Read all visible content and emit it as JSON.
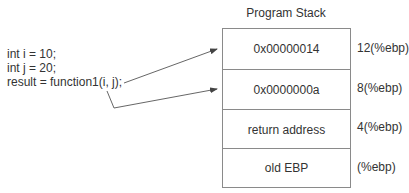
{
  "diagram": {
    "title": "Program Stack",
    "code_lines": [
      "int i = 10;",
      "int j = 20;",
      "result = function1(i, j);"
    ],
    "stack_cells": [
      {
        "value": "0x00000014",
        "offset": "12(%ebp)"
      },
      {
        "value": "0x0000000a",
        "offset": "8(%ebp)"
      },
      {
        "value": "return address",
        "offset": "4(%ebp)"
      },
      {
        "value": "old EBP",
        "offset": "(%ebp)"
      }
    ],
    "arrows": [
      {
        "from": "function1 argument j",
        "to": "0x00000014"
      },
      {
        "from": "function1 argument i",
        "to": "0x0000000a"
      }
    ],
    "colors": {
      "line": "#8a8a8a",
      "text": "#333333",
      "arrow": "#444444"
    }
  }
}
